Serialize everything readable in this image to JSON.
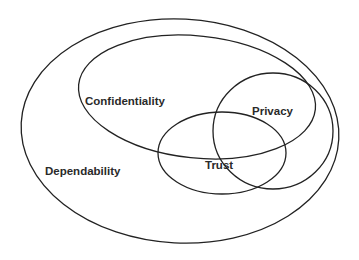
{
  "diagram": {
    "type": "euler",
    "stroke_color": "#222222",
    "background": "#ffffff",
    "sets": [
      {
        "id": "dependability",
        "label": "Dependability",
        "shape": {
          "cx": 180,
          "cy": 131,
          "rx": 159,
          "ry": 112,
          "rotate": 3
        },
        "label_pos": {
          "x": 45,
          "y": 175
        }
      },
      {
        "id": "confidentiality",
        "label": "Confidentiality",
        "shape": {
          "cx": 197,
          "cy": 97,
          "rx": 119,
          "ry": 61,
          "rotate": 6
        },
        "label_pos": {
          "x": 85,
          "y": 105
        }
      },
      {
        "id": "privacy",
        "label": "Privacy",
        "shape": {
          "cx": 273,
          "cy": 131,
          "rx": 60,
          "ry": 58,
          "rotate": 0
        },
        "label_pos": {
          "x": 252,
          "y": 115
        }
      },
      {
        "id": "trust",
        "label": "Trust",
        "shape": {
          "cx": 222,
          "cy": 153,
          "rx": 64,
          "ry": 41,
          "rotate": 0
        },
        "label_pos": {
          "x": 205,
          "y": 169
        }
      }
    ]
  }
}
